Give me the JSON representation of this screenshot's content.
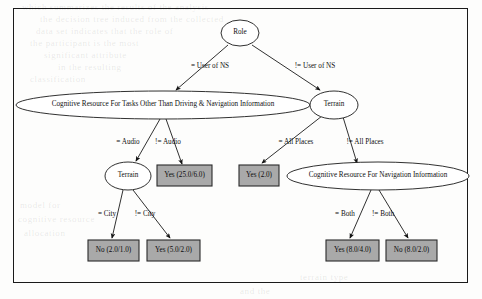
{
  "figure": {
    "type": "decision-tree",
    "border_color": "#1a1a1a",
    "leaf_fill": "#a9a9a9",
    "leaf_stroke": "#2b2b2b",
    "node_stroke": "#1a1a1a",
    "page_background": "#fdfdfc"
  },
  "nodes": {
    "root": {
      "label": "Role",
      "shape": "ellipse",
      "cx": 240,
      "cy": 33,
      "rx": 19,
      "ry": 13
    },
    "cog_other": {
      "label": "Cognitive Resource For Tasks Other Than Driving & Navigation Information",
      "shape": "ellipse",
      "cx": 163,
      "cy": 105,
      "rx": 147,
      "ry": 14
    },
    "terrain_right": {
      "label": "Terrain",
      "shape": "ellipse",
      "cx": 334,
      "cy": 105,
      "rx": 24,
      "ry": 14
    },
    "terrain_left": {
      "label": "Terrain",
      "shape": "ellipse",
      "cx": 128,
      "cy": 176,
      "rx": 23,
      "ry": 14
    },
    "cog_nav": {
      "label": "Cognitive Resource For Navigation Information",
      "shape": "ellipse",
      "cx": 378,
      "cy": 176,
      "rx": 91,
      "ry": 14
    }
  },
  "leaves": [
    {
      "id": "leaf_yes_25",
      "label": "Yes (25.0/6.0)",
      "x": 157,
      "y": 165,
      "w": 55,
      "h": 21
    },
    {
      "id": "leaf_no_2",
      "label": "No (2.0/1.0)",
      "x": 88,
      "y": 240,
      "w": 51,
      "h": 21
    },
    {
      "id": "leaf_yes_5",
      "label": "Yes (5.0/2.0)",
      "x": 147,
      "y": 240,
      "w": 53,
      "h": 21
    },
    {
      "id": "leaf_yes_2",
      "label": "Yes (2.0)",
      "x": 239,
      "y": 165,
      "w": 40,
      "h": 21
    },
    {
      "id": "leaf_yes_8",
      "label": "Yes (8.0/4.0)",
      "x": 326,
      "y": 240,
      "w": 53,
      "h": 21
    },
    {
      "id": "leaf_no_8",
      "label": "No (8.0/2.0)",
      "x": 386,
      "y": 240,
      "w": 51,
      "h": 21
    }
  ],
  "edges": [
    {
      "id": "e1",
      "from": "root",
      "to": "cog_other",
      "label": "= User of NS",
      "lx": 210,
      "ly": 67,
      "x1": 228,
      "y1": 45,
      "x2": 176,
      "y2": 90
    },
    {
      "id": "e2",
      "from": "root",
      "to": "terrain_right",
      "label": "!= User of NS",
      "lx": 315,
      "ly": 67,
      "x1": 252,
      "y1": 45,
      "x2": 320,
      "y2": 90
    },
    {
      "id": "e3",
      "from": "cog_other",
      "to": "terrain_left",
      "label": "= Audio",
      "lx": 128,
      "ly": 143,
      "x1": 160,
      "y1": 119,
      "x2": 136,
      "y2": 161
    },
    {
      "id": "e4",
      "from": "cog_other",
      "to": "leaf_yes_25",
      "label": "!= Audio",
      "lx": 168,
      "ly": 143,
      "x1": 166,
      "y1": 119,
      "x2": 182,
      "y2": 164
    },
    {
      "id": "e5",
      "from": "terrain_left",
      "to": "leaf_no_2",
      "label": "= City",
      "lx": 107,
      "ly": 215,
      "x1": 123,
      "y1": 190,
      "x2": 112,
      "y2": 238
    },
    {
      "id": "e6",
      "from": "terrain_left",
      "to": "leaf_yes_5",
      "label": "!= City",
      "lx": 145,
      "ly": 215,
      "x1": 133,
      "y1": 190,
      "x2": 170,
      "y2": 238
    },
    {
      "id": "e7",
      "from": "terrain_right",
      "to": "leaf_yes_2",
      "label": "= All Places",
      "lx": 296,
      "ly": 143,
      "x1": 322,
      "y1": 116,
      "x2": 262,
      "y2": 163
    },
    {
      "id": "e8",
      "from": "terrain_right",
      "to": "cog_nav",
      "label": "!= All Places",
      "lx": 365,
      "ly": 143,
      "x1": 343,
      "y1": 117,
      "x2": 357,
      "y2": 163
    },
    {
      "id": "e9",
      "from": "cog_nav",
      "to": "leaf_yes_8",
      "label": "= Both",
      "lx": 345,
      "ly": 215,
      "x1": 371,
      "y1": 190,
      "x2": 350,
      "y2": 238
    },
    {
      "id": "e10",
      "from": "cog_nav",
      "to": "leaf_no_8",
      "label": "!= Both",
      "lx": 383,
      "ly": 215,
      "x1": 379,
      "y1": 190,
      "x2": 408,
      "y2": 238
    }
  ],
  "bleed_text": [
    {
      "text": "which summarizes the results of the analysis",
      "x": 22,
      "y": 2,
      "size": 9
    },
    {
      "text": "the decision tree induced from the collected",
      "x": 40,
      "y": 14,
      "size": 9
    },
    {
      "text": "data set indicates that the role of",
      "x": 36,
      "y": 26,
      "size": 9
    },
    {
      "text": "the participant is the most",
      "x": 30,
      "y": 38,
      "size": 9
    },
    {
      "text": "significant attribute",
      "x": 44,
      "y": 50,
      "size": 9
    },
    {
      "text": "in the resulting",
      "x": 58,
      "y": 62,
      "size": 9
    },
    {
      "text": "classification",
      "x": 30,
      "y": 74,
      "size": 9
    },
    {
      "text": "model for",
      "x": 20,
      "y": 200,
      "size": 9
    },
    {
      "text": "cognitive resource",
      "x": 18,
      "y": 214,
      "size": 9
    },
    {
      "text": "allocation",
      "x": 24,
      "y": 228,
      "size": 9
    },
    {
      "text": "and the",
      "x": 240,
      "y": 286,
      "size": 9
    },
    {
      "text": "terrain type",
      "x": 300,
      "y": 272,
      "size": 9
    }
  ]
}
